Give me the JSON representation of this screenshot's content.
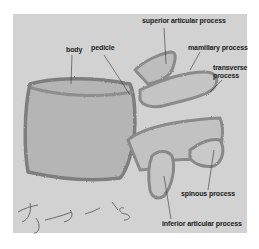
{
  "figure": {
    "labels": {
      "superior_articular_process": "superior articular process",
      "body": "body",
      "pedicle": "pedicle",
      "mamillary_process": "mamillary process",
      "transverse_process_line1": "transverse",
      "transverse_process_line2": "process",
      "spinous_process": "spinous process",
      "inferior_articular_process": "inferior articular process"
    },
    "signature": "J. S. '05",
    "colors": {
      "paper": "#d2d2d2",
      "pencil_dark": "#7a7a7a",
      "pencil_shade": "#a8a8a8",
      "label_text": "#1a1a1a",
      "leader_line": "#333333"
    }
  }
}
